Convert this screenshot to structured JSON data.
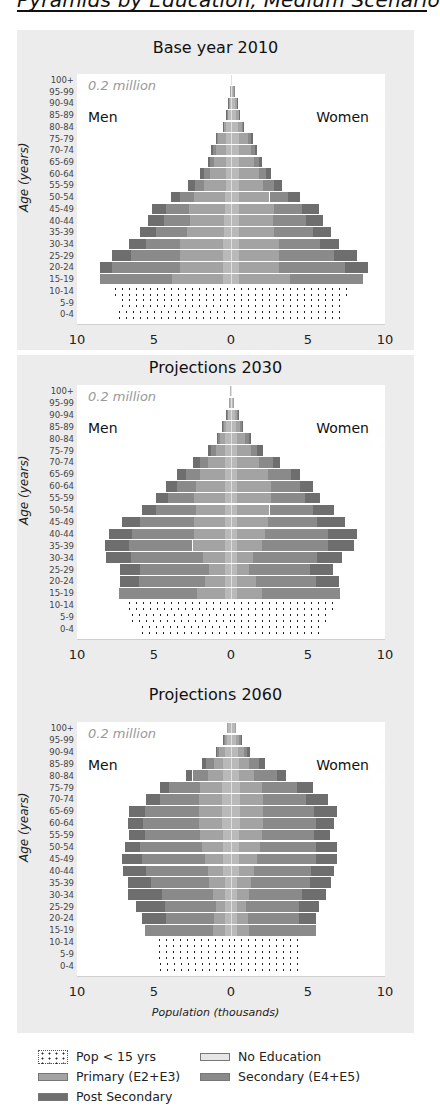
{
  "page": {
    "title": "Pyramids by Education, Medium Scenario"
  },
  "common": {
    "age_groups": [
      "100+",
      "95-99",
      "90-94",
      "85-89",
      "80-84",
      "75-79",
      "70-74",
      "65-69",
      "60-64",
      "55-59",
      "50-54",
      "45-49",
      "40-44",
      "35-39",
      "30-34",
      "25-29",
      "20-24",
      "15-19",
      "10-14",
      "5-9",
      "0-4"
    ],
    "y_axis_title": "Age (years)",
    "scale_note": "0.2 million",
    "men_label": "Men",
    "women_label": "Women",
    "x_ticks": [
      "10",
      "5",
      "0",
      "5",
      "10"
    ],
    "x_axis_title": "Population (thousands)"
  },
  "legend": {
    "items": [
      {
        "key": "child",
        "label": "Pop < 15 yrs"
      },
      {
        "key": "noedu",
        "label": "No Education"
      },
      {
        "key": "prim",
        "label": "Primary (E2+E3)"
      },
      {
        "key": "sec",
        "label": "Secondary (E4+E5)"
      },
      {
        "key": "post",
        "label": "Post Secondary"
      }
    ]
  },
  "colors": {
    "panel_bg": "#ececec",
    "plot_bg": "#ffffff",
    "no_education": "#b9b9b9",
    "primary": "#a3a3a3",
    "secondary": "#8a8a8a",
    "post_secondary": "#6e6e6e",
    "child_dots": "#222222"
  },
  "chart_data": [
    {
      "type": "bar",
      "subtype": "population-pyramid-stacked",
      "title": "Base year 2010",
      "xlabel": "",
      "ylabel": "Age (years)",
      "xlim": [
        -10,
        10
      ],
      "x_ticks": [
        10,
        5,
        0,
        5,
        10
      ],
      "annotation": "0.2 million",
      "categories": [
        "100+",
        "95-99",
        "90-94",
        "85-89",
        "80-84",
        "75-79",
        "70-74",
        "65-69",
        "60-64",
        "55-59",
        "50-54",
        "45-49",
        "40-44",
        "35-39",
        "30-34",
        "25-29",
        "20-24",
        "15-19",
        "10-14",
        "5-9",
        "0-4"
      ],
      "segment_order": [
        "No Education",
        "Primary (E2+E3)",
        "Secondary (E4+E5)",
        "Post Secondary"
      ],
      "men": [
        [
          0.02,
          0,
          0,
          0
        ],
        [
          0.04,
          0.01,
          0,
          0
        ],
        [
          0.12,
          0.04,
          0.01,
          0.01
        ],
        [
          0.2,
          0.08,
          0.01,
          0.01
        ],
        [
          0.3,
          0.2,
          0.03,
          0.02
        ],
        [
          0.3,
          0.55,
          0.1,
          0.05
        ],
        [
          0.3,
          0.7,
          0.2,
          0.1
        ],
        [
          0.3,
          0.8,
          0.25,
          0.15
        ],
        [
          0.35,
          1.0,
          0.4,
          0.25
        ],
        [
          0.35,
          1.4,
          0.6,
          0.45
        ],
        [
          0.4,
          2.0,
          0.9,
          0.6
        ],
        [
          0.4,
          2.3,
          1.5,
          0.9
        ],
        [
          0.45,
          2.2,
          1.7,
          1.05
        ],
        [
          0.45,
          2.4,
          2.0,
          1.05
        ],
        [
          0.5,
          2.8,
          2.2,
          1.1
        ],
        [
          0.5,
          2.8,
          3.2,
          1.2
        ],
        [
          0.5,
          2.8,
          4.4,
          0.8
        ],
        [
          0.5,
          3.3,
          4.7,
          0.0
        ],
        [
          7.7
        ],
        [
          7.3
        ],
        [
          7.5
        ]
      ],
      "women": [
        [
          0.03,
          0,
          0,
          0
        ],
        [
          0.15,
          0.04,
          0.01,
          0
        ],
        [
          0.28,
          0.08,
          0.02,
          0.02
        ],
        [
          0.35,
          0.15,
          0.03,
          0.02
        ],
        [
          0.45,
          0.25,
          0.06,
          0.04
        ],
        [
          0.5,
          0.6,
          0.2,
          0.1
        ],
        [
          0.5,
          0.8,
          0.25,
          0.15
        ],
        [
          0.5,
          1.0,
          0.3,
          0.2
        ],
        [
          0.5,
          1.3,
          0.5,
          0.3
        ],
        [
          0.5,
          1.6,
          0.7,
          0.5
        ],
        [
          0.5,
          2.0,
          1.2,
          0.8
        ],
        [
          0.5,
          2.3,
          1.8,
          1.1
        ],
        [
          0.5,
          2.2,
          2.2,
          1.1
        ],
        [
          0.5,
          2.3,
          2.5,
          1.2
        ],
        [
          0.5,
          2.6,
          2.7,
          1.2
        ],
        [
          0.5,
          2.6,
          3.6,
          1.5
        ],
        [
          0.5,
          2.6,
          4.3,
          1.5
        ],
        [
          0.5,
          3.3,
          4.8,
          0.0
        ],
        [
          7.8
        ],
        [
          7.4
        ],
        [
          7.2
        ]
      ]
    },
    {
      "type": "bar",
      "subtype": "population-pyramid-stacked",
      "title": "Projections 2030",
      "xlabel": "",
      "ylabel": "Age (years)",
      "xlim": [
        -10,
        10
      ],
      "x_ticks": [
        10,
        5,
        0,
        5,
        10
      ],
      "annotation": "0.2 million",
      "categories": [
        "100+",
        "95-99",
        "90-94",
        "85-89",
        "80-84",
        "75-79",
        "70-74",
        "65-69",
        "60-64",
        "55-59",
        "50-54",
        "45-49",
        "40-44",
        "35-39",
        "30-34",
        "25-29",
        "20-24",
        "15-19",
        "10-14",
        "5-9",
        "0-4"
      ],
      "segment_order": [
        "No Education",
        "Primary (E2+E3)",
        "Secondary (E4+E5)",
        "Post Secondary"
      ],
      "men": [
        [
          0.05,
          0,
          0,
          0
        ],
        [
          0.12,
          0.03,
          0,
          0
        ],
        [
          0.2,
          0.08,
          0.01,
          0.01
        ],
        [
          0.3,
          0.2,
          0.05,
          0.03
        ],
        [
          0.4,
          0.3,
          0.15,
          0.05
        ],
        [
          0.4,
          0.6,
          0.3,
          0.2
        ],
        [
          0.4,
          1.1,
          0.5,
          0.5
        ],
        [
          0.4,
          1.6,
          0.9,
          0.6
        ],
        [
          0.4,
          1.9,
          1.2,
          0.7
        ],
        [
          0.4,
          2.0,
          1.7,
          0.8
        ],
        [
          0.4,
          1.9,
          2.6,
          0.9
        ],
        [
          0.4,
          2.0,
          3.5,
          1.2
        ],
        [
          0.4,
          2.0,
          4.0,
          1.5
        ],
        [
          0.4,
          2.1,
          4.1,
          1.6
        ],
        [
          0.4,
          1.4,
          4.7,
          1.6
        ],
        [
          0.4,
          1.0,
          4.5,
          1.3
        ],
        [
          0.4,
          1.3,
          4.3,
          1.2
        ],
        [
          0.4,
          1.8,
          5.1,
          0.0
        ],
        [
          6.8
        ],
        [
          6.6
        ],
        [
          6.0
        ]
      ],
      "women": [
        [
          0.06,
          0,
          0,
          0
        ],
        [
          0.15,
          0.05,
          0,
          0
        ],
        [
          0.25,
          0.15,
          0.03,
          0.02
        ],
        [
          0.3,
          0.3,
          0.1,
          0.05
        ],
        [
          0.4,
          0.5,
          0.25,
          0.15
        ],
        [
          0.4,
          0.9,
          0.4,
          0.35
        ],
        [
          0.4,
          1.4,
          0.9,
          0.5
        ],
        [
          0.4,
          2.0,
          1.5,
          0.6
        ],
        [
          0.4,
          2.2,
          1.9,
          0.8
        ],
        [
          0.4,
          2.2,
          2.2,
          1.0
        ],
        [
          0.4,
          2.1,
          2.8,
          1.4
        ],
        [
          0.4,
          2.0,
          3.2,
          1.8
        ],
        [
          0.4,
          1.8,
          4.1,
          1.9
        ],
        [
          0.4,
          1.6,
          4.3,
          1.7
        ],
        [
          0.4,
          1.0,
          4.2,
          1.6
        ],
        [
          0.4,
          0.8,
          3.9,
          1.5
        ],
        [
          0.4,
          1.2,
          3.9,
          1.5
        ],
        [
          0.4,
          1.6,
          5.1,
          0.0
        ],
        [
          6.7
        ],
        [
          6.3
        ],
        [
          5.9
        ]
      ]
    },
    {
      "type": "bar",
      "subtype": "population-pyramid-stacked",
      "title": "Projections 2060",
      "xlabel": "Population (thousands)",
      "ylabel": "Age (years)",
      "xlim": [
        -10,
        10
      ],
      "x_ticks": [
        10,
        5,
        0,
        5,
        10
      ],
      "annotation": "0.2 million",
      "categories": [
        "100+",
        "95-99",
        "90-94",
        "85-89",
        "80-84",
        "75-79",
        "70-74",
        "65-69",
        "60-64",
        "55-59",
        "50-54",
        "45-49",
        "40-44",
        "35-39",
        "30-34",
        "25-29",
        "20-24",
        "15-19",
        "10-14",
        "5-9",
        "0-4"
      ],
      "segment_order": [
        "No Education",
        "Primary (E2+E3)",
        "Secondary (E4+E5)",
        "Post Secondary"
      ],
      "men": [
        [
          0.2,
          0.05,
          0,
          0
        ],
        [
          0.25,
          0.15,
          0.05,
          0.05
        ],
        [
          0.4,
          0.35,
          0.15,
          0.1
        ],
        [
          0.5,
          0.6,
          0.5,
          0.3
        ],
        [
          0.5,
          1.0,
          1.0,
          0.4
        ],
        [
          0.6,
          1.4,
          2.0,
          0.6
        ],
        [
          0.6,
          1.5,
          2.5,
          0.9
        ],
        [
          0.6,
          1.5,
          3.5,
          1.0
        ],
        [
          0.6,
          1.5,
          3.6,
          1.0
        ],
        [
          0.5,
          1.5,
          3.6,
          1.0
        ],
        [
          0.5,
          1.4,
          4.0,
          1.0
        ],
        [
          0.5,
          1.2,
          4.1,
          1.3
        ],
        [
          0.5,
          1.0,
          4.0,
          1.5
        ],
        [
          0.4,
          1.0,
          3.8,
          1.5
        ],
        [
          0.4,
          0.8,
          3.3,
          2.2
        ],
        [
          0.4,
          0.6,
          3.3,
          1.9
        ],
        [
          0.4,
          0.7,
          3.1,
          1.6
        ],
        [
          0.4,
          0.8,
          4.4,
          0.0
        ],
        [
          4.9
        ],
        [
          4.9
        ],
        [
          4.8
        ]
      ],
      "women": [
        [
          0.25,
          0.1,
          0,
          0
        ],
        [
          0.3,
          0.25,
          0.1,
          0.05
        ],
        [
          0.45,
          0.4,
          0.2,
          0.2
        ],
        [
          0.5,
          0.7,
          0.6,
          0.4
        ],
        [
          0.5,
          1.0,
          1.5,
          0.6
        ],
        [
          0.6,
          1.4,
          2.3,
          1.0
        ],
        [
          0.6,
          1.5,
          2.8,
          1.4
        ],
        [
          0.6,
          1.5,
          3.3,
          1.5
        ],
        [
          0.6,
          1.5,
          3.4,
          1.2
        ],
        [
          0.5,
          1.5,
          3.4,
          1.0
        ],
        [
          0.5,
          1.4,
          3.6,
          1.4
        ],
        [
          0.5,
          1.2,
          3.8,
          1.4
        ],
        [
          0.5,
          1.0,
          3.7,
          1.5
        ],
        [
          0.4,
          0.9,
          3.8,
          1.4
        ],
        [
          0.4,
          0.8,
          3.4,
          1.6
        ],
        [
          0.4,
          0.6,
          3.4,
          1.3
        ],
        [
          0.4,
          0.7,
          3.3,
          1.1
        ],
        [
          0.4,
          0.8,
          4.3,
          0.0
        ],
        [
          4.7
        ],
        [
          4.7
        ],
        [
          4.4
        ]
      ]
    }
  ],
  "layout": {
    "charts": [
      {
        "panel_top": 30,
        "panel_height": 320,
        "title_top": 8,
        "plot_top": 44,
        "plot_height": 246
      },
      {
        "panel_top": 355,
        "panel_height": 310,
        "title_top": 3,
        "plot_top": 30,
        "plot_height": 250
      },
      {
        "panel_top": 665,
        "panel_height": 368,
        "title_top": 20,
        "plot_top": 57,
        "plot_height": 250
      }
    ]
  }
}
